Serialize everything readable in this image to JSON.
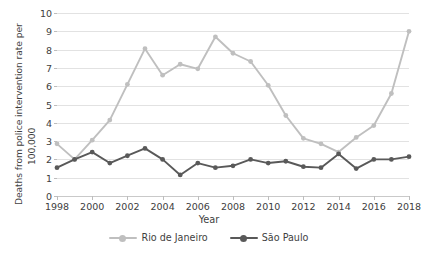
{
  "axes": {
    "ylabel_line1": "Deaths from police intervention rate per",
    "ylabel_line2": "100,000",
    "xlabel": "Year",
    "ytick_labels": [
      "10",
      "9",
      "8",
      "7",
      "6",
      "5",
      "4",
      "3",
      "2",
      "1",
      "0"
    ],
    "xtick_labels": [
      "1998",
      "2000",
      "2002",
      "2004",
      "2006",
      "2008",
      "2010",
      "2012",
      "2014",
      "2016",
      "2018"
    ]
  },
  "legend": {
    "items": [
      {
        "label": "Rio de Janeiro",
        "color": "#bfbfbf"
      },
      {
        "label": "São Paulo",
        "color": "#595959"
      }
    ]
  },
  "caption": "",
  "chart_data": {
    "type": "line",
    "title": "",
    "xlabel": "Year",
    "ylabel": "Deaths from police intervention rate per 100,000",
    "xlim": [
      1998,
      2018
    ],
    "ylim": [
      0,
      10
    ],
    "ytick_step": 1,
    "grid": true,
    "legend_position": "bottom",
    "x": [
      1998,
      1999,
      2000,
      2001,
      2002,
      2003,
      2004,
      2005,
      2006,
      2007,
      2008,
      2009,
      2010,
      2011,
      2012,
      2013,
      2014,
      2015,
      2016,
      2017,
      2018
    ],
    "series": [
      {
        "name": "Rio de Janeiro",
        "color": "#bfbfbf",
        "values": [
          2.85,
          2.0,
          3.05,
          4.15,
          6.1,
          8.05,
          6.6,
          7.2,
          6.95,
          8.7,
          7.8,
          7.35,
          6.05,
          4.4,
          3.15,
          2.85,
          2.4,
          3.2,
          3.85,
          5.6,
          9.0
        ]
      },
      {
        "name": "São Paulo",
        "color": "#595959",
        "values": [
          1.55,
          2.0,
          2.4,
          1.8,
          2.2,
          2.6,
          2.0,
          1.15,
          1.8,
          1.55,
          1.65,
          2.0,
          1.8,
          1.9,
          1.6,
          1.55,
          2.3,
          1.5,
          2.0,
          2.0,
          2.15
        ]
      }
    ]
  }
}
